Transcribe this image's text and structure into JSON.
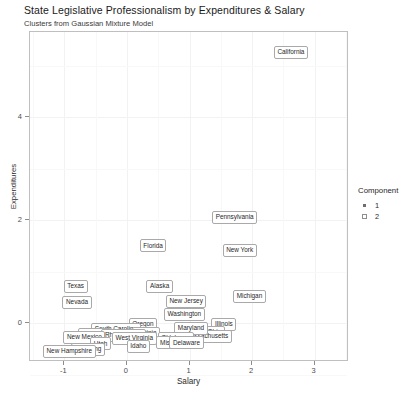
{
  "chart_data": {
    "type": "scatter",
    "title": "State Legislative Professionalism by Expenditures & Salary",
    "subtitle": "Clusters from Gaussian Mixture Model",
    "xlabel": "Salary",
    "ylabel": "Expenditures",
    "xlim": [
      -1.55,
      3.55
    ],
    "ylim": [
      -0.75,
      5.65
    ],
    "xticks": [
      "-1",
      "0",
      "1",
      "2",
      "3"
    ],
    "xtick_values": [
      -1,
      0,
      1,
      2,
      3
    ],
    "yticks": [
      "0",
      "2",
      "4"
    ],
    "ytick_values": [
      0,
      2,
      4
    ],
    "grid": true,
    "legend_position": "right",
    "legend": {
      "title": "Component",
      "entries": [
        {
          "label": "1",
          "marker": "filled-square"
        },
        {
          "label": "2",
          "marker": "open-square"
        }
      ]
    },
    "point_label_style": "boxed-repelled-text",
    "points": [
      {
        "label": "California",
        "x": 2.62,
        "y": 5.25,
        "component": 2
      },
      {
        "label": "Pennsylvania",
        "x": 1.72,
        "y": 2.05,
        "component": 2
      },
      {
        "label": "New York",
        "x": 1.8,
        "y": 1.42,
        "component": 2
      },
      {
        "label": "Florida",
        "x": 0.42,
        "y": 1.5,
        "component": 2
      },
      {
        "label": "Michigan",
        "x": 1.96,
        "y": 0.52,
        "component": 2
      },
      {
        "label": "Alaska",
        "x": 0.52,
        "y": 0.72,
        "component": 2
      },
      {
        "label": "New Jersey",
        "x": 0.95,
        "y": 0.42,
        "component": 2
      },
      {
        "label": "Washington",
        "x": 0.92,
        "y": 0.18,
        "component": 2
      },
      {
        "label": "Texas",
        "x": -0.82,
        "y": 0.72,
        "component": 1
      },
      {
        "label": "Nevada",
        "x": -0.8,
        "y": 0.4,
        "component": 1
      },
      {
        "label": "Illinois",
        "x": 1.55,
        "y": -0.02,
        "component": 2
      },
      {
        "label": "Ohio",
        "x": 1.4,
        "y": -0.18,
        "component": 2
      },
      {
        "label": "Massachusetts",
        "x": 1.28,
        "y": -0.25,
        "component": 2
      },
      {
        "label": "Maryland",
        "x": 1.02,
        "y": -0.1,
        "component": 1
      },
      {
        "label": "Oregon",
        "x": 0.26,
        "y": -0.02,
        "component": 1
      },
      {
        "label": "South Carolina",
        "x": -0.18,
        "y": -0.12,
        "component": 1
      },
      {
        "label": "Virginia",
        "x": 0.3,
        "y": -0.2,
        "component": 1
      },
      {
        "label": "Alabama",
        "x": -0.52,
        "y": -0.22,
        "component": 1
      },
      {
        "label": "Rhode Island",
        "x": -0.05,
        "y": -0.24,
        "component": 1
      },
      {
        "label": "New Mexico",
        "x": -0.68,
        "y": -0.28,
        "component": 1
      },
      {
        "label": "West Virginia",
        "x": 0.12,
        "y": -0.3,
        "component": 1
      },
      {
        "label": "Oklahoma",
        "x": 0.78,
        "y": -0.3,
        "component": 1
      },
      {
        "label": "Missouri",
        "x": 0.72,
        "y": -0.38,
        "component": 1
      },
      {
        "label": "Delaware",
        "x": 0.95,
        "y": -0.38,
        "component": 1
      },
      {
        "label": "Utah",
        "x": -0.42,
        "y": -0.4,
        "component": 1
      },
      {
        "label": "Idaho",
        "x": 0.18,
        "y": -0.44,
        "component": 1
      },
      {
        "label": "Wyoming",
        "x": -0.62,
        "y": -0.5,
        "component": 1
      },
      {
        "label": "New Hampshire",
        "x": -0.92,
        "y": -0.54,
        "component": 1
      }
    ]
  }
}
